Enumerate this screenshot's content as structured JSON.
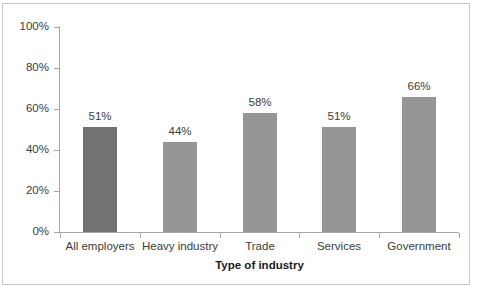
{
  "chart_data": {
    "type": "bar",
    "title": "",
    "xlabel": "Type of industry",
    "ylabel": "",
    "categories": [
      "All employers",
      "Heavy industry",
      "Trade",
      "Services",
      "Government"
    ],
    "values": [
      51,
      44,
      58,
      51,
      66
    ],
    "value_labels": [
      "51%",
      "44%",
      "58%",
      "51%",
      "66%"
    ],
    "bar_colors": [
      "#737373",
      "#969696",
      "#969696",
      "#969696",
      "#969696"
    ],
    "ylim": [
      0,
      100
    ],
    "yticks": [
      0,
      20,
      40,
      60,
      80,
      100
    ],
    "ytick_labels": [
      "0%",
      "20%",
      "40%",
      "60%",
      "80%",
      "100%"
    ],
    "grid": false,
    "legend": false,
    "legend_position": "none",
    "axis_color": "#a6a6a6",
    "text_color": "#3b3b3b",
    "border_color": "#c9c9c9",
    "background": "#ffffff"
  }
}
